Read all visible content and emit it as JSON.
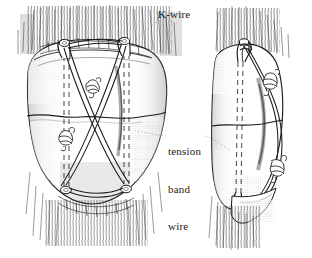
{
  "figure": {
    "background_color": "#ffffff",
    "ink_color": "#1b1b1b",
    "shade_color": "#7d7d7d",
    "panels": [
      {
        "name": "anterior-view",
        "description": "Frontal (anterior) view of patella with two parallel K-wires and figure-of-eight tension band wire"
      },
      {
        "name": "lateral-view",
        "description": "Lateral (side) view of patella showing bent K-wire end and tension band wire over anterior surface"
      }
    ]
  },
  "labels": {
    "kwire": "K-wire",
    "tension_band": {
      "line1": "tension",
      "line2": "band",
      "line3": "wire"
    }
  },
  "annotations": {
    "leader_kwire": "dotted-leader-line",
    "leader_tension": "dotted-leader-line"
  },
  "icons": {
    "kwire_end": "bent-k-wire-end-icon",
    "wire_twist": "twisted-wire-knot-icon",
    "fracture_line": "transverse-fracture-line-icon",
    "buried_wire": "dashed-buried-k-wire-icon",
    "soft_tissue": "hatched-soft-tissue-icon"
  }
}
